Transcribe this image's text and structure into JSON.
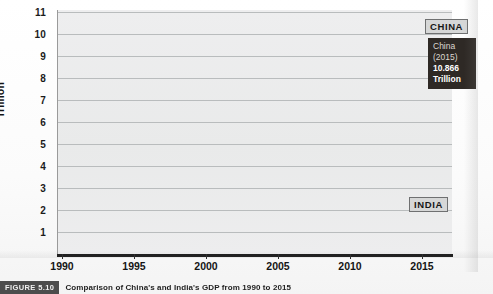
{
  "figure": {
    "badge": "FIGURE 5.10",
    "caption": "Comparison of China's and India's GDP from 1990 to 2015"
  },
  "tooltip": {
    "country": "China",
    "year": "(2015)",
    "value": "10.866",
    "unit": "Trillion"
  },
  "tags": {
    "china": "CHINA",
    "india": "INDIA"
  },
  "colors": {
    "plot_background": "#ecedee",
    "gridline": "#b9bcbd",
    "series_line": "#4a4a4a",
    "axis": "#1a1a1a",
    "tag_background": "#d6d7d7",
    "tooltip_background": "#2e2925"
  },
  "chart_data": {
    "type": "line",
    "title": "Comparison of China's and India's GDP from 1990 to 2015",
    "xlabel": "",
    "ylabel": "Trillion",
    "xlim": [
      1990,
      2016
    ],
    "ylim": [
      0,
      11
    ],
    "xticks": [
      "1990",
      "1995",
      "2000",
      "2005",
      "2010",
      "2015"
    ],
    "yticks": [
      "1",
      "2",
      "3",
      "4",
      "5",
      "6",
      "7",
      "8",
      "9",
      "10",
      "11"
    ],
    "grid": true,
    "legend_position": "inline-labels",
    "x": [
      1990,
      1991,
      1992,
      1993,
      1994,
      1995,
      1996,
      1997,
      1998,
      1999,
      2000,
      2001,
      2002,
      2003,
      2004,
      2005,
      2006,
      2007,
      2008,
      2009,
      2010,
      2011,
      2012,
      2013,
      2014,
      2015
    ],
    "series": [
      {
        "name": "CHINA",
        "values": [
          0.36,
          0.38,
          0.43,
          0.44,
          0.56,
          0.73,
          0.86,
          0.96,
          1.03,
          1.09,
          1.21,
          1.34,
          1.47,
          1.66,
          1.96,
          2.29,
          2.75,
          3.55,
          4.59,
          5.11,
          6.09,
          7.55,
          8.53,
          9.57,
          10.44,
          10.866
        ],
        "annotation": "China (2015) 10.866 Trillion"
      },
      {
        "name": "INDIA",
        "values": [
          0.32,
          0.27,
          0.29,
          0.28,
          0.33,
          0.36,
          0.39,
          0.42,
          0.42,
          0.46,
          0.47,
          0.49,
          0.52,
          0.62,
          0.72,
          0.83,
          0.95,
          1.22,
          1.2,
          1.34,
          1.68,
          1.82,
          1.83,
          1.86,
          2.04,
          2.1
        ]
      }
    ],
    "annotations": [
      {
        "label": "CHINA",
        "x": 2015,
        "y": 10.866
      },
      {
        "label": "INDIA",
        "x": 2015,
        "y": 2.1
      }
    ]
  }
}
